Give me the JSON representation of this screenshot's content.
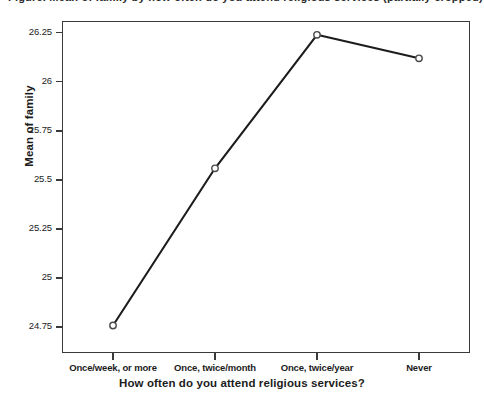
{
  "top_cut_text": "Figure. Mean of family by how often do you attend religious services (partially cropped)",
  "chart_data": {
    "type": "line",
    "title": "",
    "xlabel": "How often do you attend religious services?",
    "ylabel": "Mean of family",
    "categories": [
      "Once/week, or more",
      "Once, twice/month",
      "Once, twice/year",
      "Never"
    ],
    "values": [
      24.76,
      25.56,
      26.24,
      26.12
    ],
    "yticks": [
      "24.75",
      "25",
      "25.25",
      "25.5",
      "25.75",
      "26",
      "26.25"
    ],
    "ytick_values": [
      24.75,
      25,
      25.25,
      25.5,
      25.75,
      26,
      26.25
    ],
    "ylim": [
      24.62,
      26.31
    ],
    "grid": false,
    "legend": false,
    "marker": "open-circle",
    "line_color": "#1c1c1c",
    "marker_fill": "#ffffff",
    "marker_edge": "#4a4a4a",
    "frame_color": "#3a3a3a",
    "background": "#ffffff"
  }
}
